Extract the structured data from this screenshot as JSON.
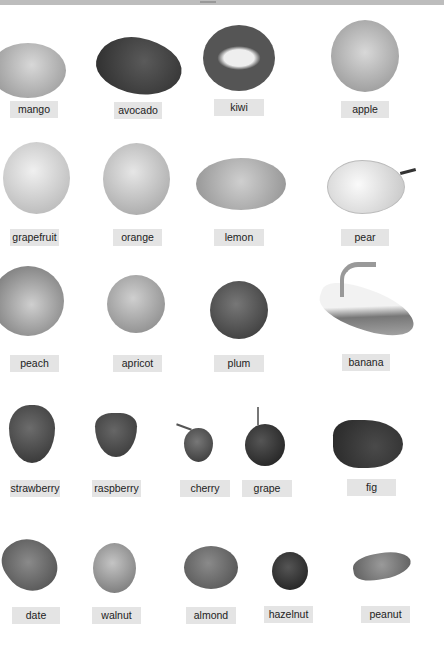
{
  "page": {
    "colors": {
      "background": "#ffffff",
      "label_bg": "#e4e4e4",
      "label_text": "#222222"
    }
  },
  "items": [
    {
      "label": "mango"
    },
    {
      "label": "avocado"
    },
    {
      "label": "kiwi"
    },
    {
      "label": "apple"
    },
    {
      "label": "grapefruit"
    },
    {
      "label": "orange"
    },
    {
      "label": "lemon"
    },
    {
      "label": "pear"
    },
    {
      "label": "peach"
    },
    {
      "label": "apricot"
    },
    {
      "label": "plum"
    },
    {
      "label": "banana"
    },
    {
      "label": "strawberry"
    },
    {
      "label": "raspberry"
    },
    {
      "label": "cherry"
    },
    {
      "label": "grape"
    },
    {
      "label": "fig"
    },
    {
      "label": "date"
    },
    {
      "label": "walnut"
    },
    {
      "label": "almond"
    },
    {
      "label": "hazelnut"
    },
    {
      "label": "peanut"
    }
  ]
}
